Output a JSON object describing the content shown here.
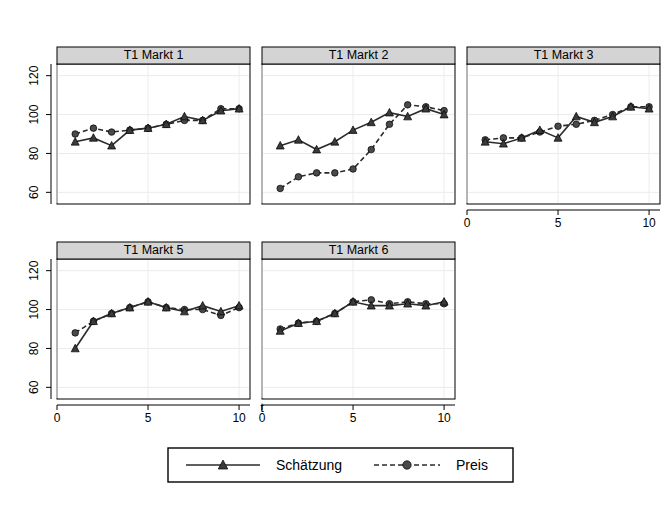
{
  "figure": {
    "xlabel": "t",
    "panel_titles": [
      "T1 Markt 1",
      "T1 Markt 2",
      "T1 Markt 3",
      "T1 Markt 5",
      "T1 Markt 6"
    ],
    "legend": {
      "entries": [
        {
          "label": "Schätzung",
          "style": "solid-line-triangle-marker"
        },
        {
          "label": "Preis",
          "style": "dashed-line-circle-marker"
        }
      ]
    },
    "y_tick_labels": [
      "60",
      "80",
      "100",
      "120"
    ],
    "x_tick_labels": [
      "0",
      "5",
      "10"
    ],
    "colors": {
      "strip_background": "#d4d4d4",
      "panel_background": "#ffffff",
      "line": "#2b2b2b",
      "grid": "#efeaea",
      "axis": "#000000"
    }
  },
  "chart_data": {
    "type": "line",
    "title": "",
    "xlabel": "t",
    "ylabel": "",
    "xlim": [
      0,
      10.6
    ],
    "ylim": [
      54,
      126
    ],
    "xticks": [
      0,
      5,
      10
    ],
    "yticks": [
      60,
      80,
      100,
      120
    ],
    "grid": true,
    "legend_position": "bottom-center",
    "legend": [
      "Schätzung",
      "Preis"
    ],
    "x": [
      1,
      2,
      3,
      4,
      5,
      6,
      7,
      8,
      9,
      10
    ],
    "panels": [
      {
        "title": "T1 Markt 1",
        "series": [
          {
            "name": "Schätzung",
            "values": [
              86,
              88,
              84,
              92,
              93,
              95,
              99,
              97,
              102,
              103
            ]
          },
          {
            "name": "Preis",
            "values": [
              90,
              93,
              91,
              92,
              93,
              95,
              97,
              97,
              103,
              103
            ]
          }
        ]
      },
      {
        "title": "T1 Markt 2",
        "series": [
          {
            "name": "Schätzung",
            "values": [
              84,
              87,
              82,
              86,
              92,
              96,
              101,
              99,
              103,
              100
            ]
          },
          {
            "name": "Preis",
            "values": [
              62,
              68,
              70,
              70,
              72,
              82,
              95,
              105,
              104,
              102
            ]
          }
        ]
      },
      {
        "title": "T1 Markt 3",
        "series": [
          {
            "name": "Schätzung",
            "values": [
              86,
              85,
              88,
              92,
              88,
              99,
              96,
              99,
              104,
              103
            ]
          },
          {
            "name": "Preis",
            "values": [
              87,
              88,
              88,
              91,
              94,
              95,
              97,
              100,
              104,
              104
            ]
          }
        ]
      },
      {
        "title": "T1 Markt 5",
        "series": [
          {
            "name": "Schätzung",
            "values": [
              80,
              94,
              98,
              101,
              104,
              101,
              99,
              102,
              99,
              102
            ]
          },
          {
            "name": "Preis",
            "values": [
              88,
              94,
              98,
              101,
              104,
              101,
              100,
              100,
              97,
              101
            ]
          }
        ]
      },
      {
        "title": "T1 Markt 6",
        "series": [
          {
            "name": "Schätzung",
            "values": [
              89,
              93,
              94,
              98,
              104,
              102,
              102,
              103,
              102,
              104
            ]
          },
          {
            "name": "Preis",
            "values": [
              90,
              93,
              94,
              98,
              104,
              105,
              103,
              104,
              103,
              103
            ]
          }
        ]
      }
    ]
  }
}
